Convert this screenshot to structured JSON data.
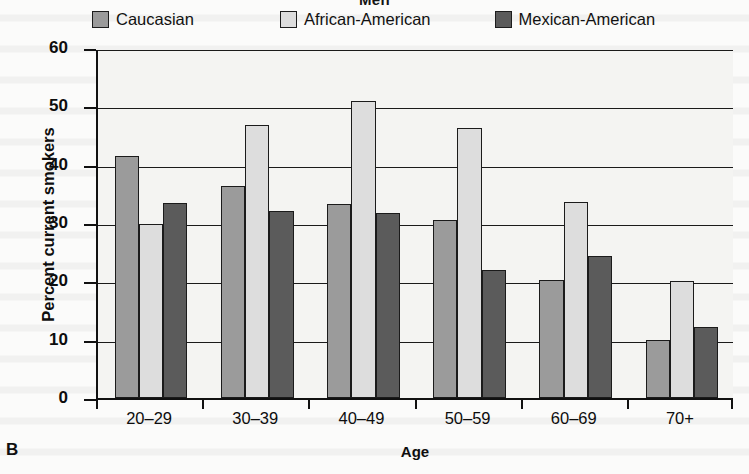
{
  "panel": {
    "letter": "B"
  },
  "title": "Men",
  "axes": {
    "ylabel": "Percent current smokers",
    "xlabel": "Age",
    "yticks": [
      "0",
      "10",
      "20",
      "30",
      "40",
      "50",
      "60"
    ]
  },
  "legend": [
    {
      "label": "Caucasian",
      "color": "#9b9b9b"
    },
    {
      "label": "African-American",
      "color": "#dddddd"
    },
    {
      "label": "Mexican-American",
      "color": "#5b5b5b"
    }
  ],
  "chart_data": {
    "type": "bar",
    "title": "Men",
    "xlabel": "Age",
    "ylabel": "Percent current smokers",
    "ylim": [
      0,
      60
    ],
    "ytick_step": 10,
    "grid": true,
    "legend_position": "top",
    "categories": [
      "20–29",
      "30–39",
      "40–49",
      "50–59",
      "60–69",
      "70+"
    ],
    "series": [
      {
        "name": "Caucasian",
        "color": "#9b9b9b",
        "values": [
          41.5,
          36.3,
          33.2,
          30.6,
          20.2,
          10.0
        ]
      },
      {
        "name": "African-American",
        "color": "#dddddd",
        "values": [
          29.9,
          46.8,
          51.0,
          46.3,
          33.6,
          20.0
        ]
      },
      {
        "name": "Mexican-American",
        "color": "#5b5b5b",
        "values": [
          33.4,
          32.1,
          31.7,
          22.0,
          24.3,
          12.2
        ]
      }
    ]
  }
}
